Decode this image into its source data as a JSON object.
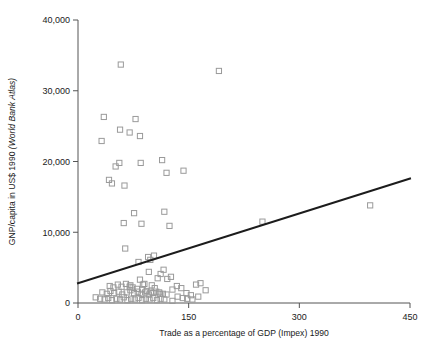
{
  "chart_data": {
    "type": "scatter",
    "title": "",
    "xlabel": "Trade as a percentage of GDP (Impex) 1990",
    "ylabel_plain": "GNP/capita in US$ 1990 ",
    "ylabel_italic": "(World Bank Atlas)",
    "ylabel": "GNP/capita in US$ 1990 (World Bank Atlas)",
    "xlim": [
      0,
      450
    ],
    "ylim": [
      0,
      40000
    ],
    "xticks": [
      0,
      150,
      300,
      450
    ],
    "xtick_labels": [
      "0",
      "150",
      "300",
      "450"
    ],
    "yticks": [
      0,
      10000,
      20000,
      30000,
      40000
    ],
    "ytick_labels": [
      "0",
      "10,000",
      "20,000",
      "30,000",
      "40,000"
    ],
    "grid": false,
    "legend": null,
    "marker_style": "open-square",
    "marker_color": "#9a9a9a",
    "line_color": "#1c1c1c",
    "trend_line": {
      "label": "fitted regression line",
      "x": [
        0,
        450
      ],
      "y": [
        2800,
        17600
      ]
    },
    "points": [
      [
        58,
        33700
      ],
      [
        191,
        32800
      ],
      [
        35,
        26300
      ],
      [
        57,
        24500
      ],
      [
        70,
        24100
      ],
      [
        78,
        26000
      ],
      [
        84,
        23600
      ],
      [
        32,
        22900
      ],
      [
        396,
        13800
      ],
      [
        42,
        17400
      ],
      [
        46,
        16900
      ],
      [
        56,
        19800
      ],
      [
        51,
        19300
      ],
      [
        63,
        16600
      ],
      [
        85,
        19800
      ],
      [
        114,
        20200
      ],
      [
        120,
        18400
      ],
      [
        143,
        18700
      ],
      [
        62,
        11300
      ],
      [
        76,
        12700
      ],
      [
        86,
        11200
      ],
      [
        117,
        12900
      ],
      [
        124,
        10900
      ],
      [
        64,
        7700
      ],
      [
        82,
        5800
      ],
      [
        95,
        6500
      ],
      [
        98,
        6100
      ],
      [
        103,
        6700
      ],
      [
        96,
        4400
      ],
      [
        112,
        4100
      ],
      [
        116,
        4700
      ],
      [
        108,
        3500
      ],
      [
        121,
        3400
      ],
      [
        126,
        3700
      ],
      [
        84,
        3300
      ],
      [
        90,
        2700
      ],
      [
        71,
        2500
      ],
      [
        74,
        2200
      ],
      [
        80,
        2000
      ],
      [
        87,
        1900
      ],
      [
        93,
        1700
      ],
      [
        99,
        1600
      ],
      [
        104,
        2100
      ],
      [
        110,
        1500
      ],
      [
        115,
        1300
      ],
      [
        120,
        1200
      ],
      [
        128,
        1900
      ],
      [
        134,
        2400
      ],
      [
        140,
        2100
      ],
      [
        147,
        1400
      ],
      [
        153,
        1100
      ],
      [
        160,
        2600
      ],
      [
        166,
        2800
      ],
      [
        173,
        1800
      ],
      [
        135,
        900
      ],
      [
        142,
        700
      ],
      [
        148,
        600
      ],
      [
        24,
        800
      ],
      [
        30,
        600
      ],
      [
        36,
        500
      ],
      [
        41,
        700
      ],
      [
        46,
        400
      ],
      [
        52,
        600
      ],
      [
        57,
        500
      ],
      [
        62,
        800
      ],
      [
        67,
        400
      ],
      [
        72,
        600
      ],
      [
        77,
        500
      ],
      [
        82,
        700
      ],
      [
        87,
        400
      ],
      [
        92,
        600
      ],
      [
        97,
        500
      ],
      [
        102,
        700
      ],
      [
        107,
        400
      ],
      [
        112,
        600
      ],
      [
        117,
        500
      ],
      [
        33,
        1500
      ],
      [
        39,
        1300
      ],
      [
        44,
        1700
      ],
      [
        49,
        1400
      ],
      [
        55,
        1600
      ],
      [
        60,
        1200
      ],
      [
        66,
        1500
      ],
      [
        71,
        1800
      ],
      [
        76,
        1400
      ],
      [
        81,
        1600
      ],
      [
        86,
        1300
      ],
      [
        91,
        1500
      ],
      [
        96,
        1200
      ],
      [
        101,
        1400
      ],
      [
        106,
        1600
      ],
      [
        111,
        1300
      ],
      [
        43,
        2400
      ],
      [
        48,
        2200
      ],
      [
        54,
        2600
      ],
      [
        59,
        2300
      ],
      [
        65,
        2700
      ],
      [
        70,
        2300
      ],
      [
        88,
        2600
      ],
      [
        100,
        2500
      ],
      [
        250,
        11500
      ],
      [
        128,
        300
      ],
      [
        155,
        500
      ],
      [
        163,
        900
      ]
    ]
  }
}
